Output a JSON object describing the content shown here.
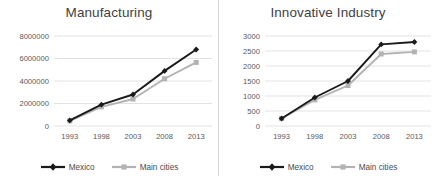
{
  "colors": {
    "series_mexico": "#1a1a1a",
    "series_main_cities": "#b3b3b3",
    "gridline": "#e3e3e3",
    "axis_text": "#59595b",
    "title_text": "#3f3f3f",
    "panel_divider": "#d9d9d9",
    "background": "#ffffff"
  },
  "legend": {
    "mexico_label": "Mexico",
    "main_cities_label": "Main cities",
    "mexico_marker": "diamond-marker-icon",
    "main_cities_marker": "square-marker-icon"
  },
  "chart_data": [
    {
      "type": "line",
      "title": "Manufacturing",
      "xlabel": "",
      "ylabel": "",
      "x": [
        "1993",
        "1998",
        "2003",
        "2008",
        "2013"
      ],
      "categories": [
        "1993",
        "1998",
        "2003",
        "2008",
        "2013"
      ],
      "yticks": [
        "0",
        "2000000",
        "4000000",
        "6000000",
        "8000000"
      ],
      "ytick_values": [
        0,
        2000000,
        4000000,
        6000000,
        8000000
      ],
      "ylim": [
        0,
        8000000
      ],
      "grid": "horizontal",
      "legend_position": "bottom-center",
      "series": [
        {
          "name": "Mexico",
          "color": "#1a1a1a",
          "marker": "diamond",
          "values": [
            500000,
            1900000,
            2800000,
            4900000,
            6800000
          ]
        },
        {
          "name": "Main cities",
          "color": "#b3b3b3",
          "marker": "square",
          "values": [
            450000,
            1700000,
            2400000,
            4200000,
            5650000
          ]
        }
      ]
    },
    {
      "type": "line",
      "title": "Innovative Industry",
      "xlabel": "",
      "ylabel": "",
      "x": [
        "1993",
        "1998",
        "2003",
        "2008",
        "2013"
      ],
      "categories": [
        "1993",
        "1998",
        "2003",
        "2008",
        "2013"
      ],
      "yticks": [
        "0",
        "500",
        "1000",
        "1500",
        "2000",
        "2500",
        "3000"
      ],
      "ytick_values": [
        0,
        500,
        1000,
        1500,
        2000,
        2500,
        3000
      ],
      "ylim": [
        0,
        3000
      ],
      "grid": "horizontal",
      "legend_position": "bottom-center",
      "series": [
        {
          "name": "Mexico",
          "color": "#1a1a1a",
          "marker": "diamond",
          "values": [
            250,
            950,
            1500,
            2720,
            2800
          ]
        },
        {
          "name": "Main cities",
          "color": "#b3b3b3",
          "marker": "square",
          "values": [
            250,
            870,
            1350,
            2400,
            2470
          ]
        }
      ]
    }
  ]
}
